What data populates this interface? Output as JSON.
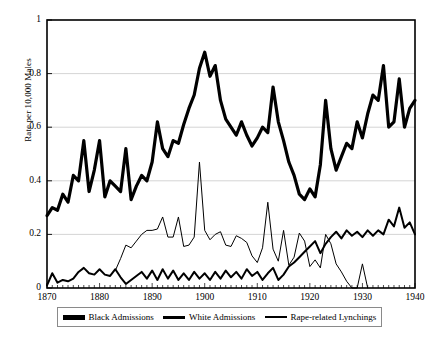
{
  "chart_data": {
    "type": "line",
    "title": "",
    "xlabel": "",
    "ylabel": "Rate per 10,000 Males",
    "xlim": [
      1870,
      1940
    ],
    "ylim": [
      0,
      1
    ],
    "grid": true,
    "legend_position": "bottom",
    "y_ticks": [
      "0",
      "0.2",
      "0.4",
      "0.6",
      "0.8",
      "1"
    ],
    "y_tick_values": [
      0,
      0.2,
      0.4,
      0.6,
      0.8,
      1
    ],
    "x_ticks": [
      "1870",
      "1880",
      "1890",
      "1900",
      "1910",
      "1920",
      "1930",
      "1940"
    ],
    "x_tick_values": [
      1870,
      1880,
      1890,
      1900,
      1910,
      1920,
      1930,
      1940
    ],
    "x_minor_tick_step": 1,
    "series": [
      {
        "name": "Black Admissions",
        "line_width": 3.2,
        "color": "#000000",
        "x": [
          1870,
          1871,
          1872,
          1873,
          1874,
          1875,
          1876,
          1877,
          1878,
          1879,
          1880,
          1881,
          1882,
          1883,
          1884,
          1885,
          1886,
          1887,
          1888,
          1889,
          1890,
          1891,
          1892,
          1893,
          1894,
          1895,
          1896,
          1897,
          1898,
          1899,
          1900,
          1901,
          1902,
          1903,
          1904,
          1905,
          1906,
          1907,
          1908,
          1909,
          1910,
          1911,
          1912,
          1913,
          1914,
          1915,
          1916,
          1917,
          1918,
          1919,
          1920,
          1921,
          1922,
          1923,
          1924,
          1925,
          1926,
          1927,
          1928,
          1929,
          1930,
          1931,
          1932,
          1933,
          1934,
          1935,
          1936,
          1937,
          1938,
          1939,
          1940
        ],
        "values": [
          0.27,
          0.3,
          0.29,
          0.35,
          0.32,
          0.42,
          0.4,
          0.55,
          0.36,
          0.44,
          0.55,
          0.34,
          0.4,
          0.38,
          0.36,
          0.52,
          0.33,
          0.38,
          0.42,
          0.4,
          0.47,
          0.62,
          0.52,
          0.49,
          0.55,
          0.54,
          0.61,
          0.67,
          0.72,
          0.82,
          0.88,
          0.79,
          0.83,
          0.7,
          0.63,
          0.6,
          0.57,
          0.62,
          0.57,
          0.53,
          0.56,
          0.6,
          0.58,
          0.75,
          0.62,
          0.55,
          0.47,
          0.42,
          0.35,
          0.33,
          0.37,
          0.34,
          0.46,
          0.7,
          0.52,
          0.44,
          0.49,
          0.54,
          0.52,
          0.62,
          0.56,
          0.65,
          0.72,
          0.7,
          0.83,
          0.6,
          0.62,
          0.78,
          0.6,
          0.67,
          0.7
        ]
      },
      {
        "name": "White Admissions",
        "line_width": 2.0,
        "color": "#000000",
        "x": [
          1870,
          1871,
          1872,
          1873,
          1874,
          1875,
          1876,
          1877,
          1878,
          1879,
          1880,
          1881,
          1882,
          1883,
          1884,
          1885,
          1886,
          1887,
          1888,
          1889,
          1890,
          1891,
          1892,
          1893,
          1894,
          1895,
          1896,
          1897,
          1898,
          1899,
          1900,
          1901,
          1902,
          1903,
          1904,
          1905,
          1906,
          1907,
          1908,
          1909,
          1910,
          1911,
          1912,
          1913,
          1914,
          1915,
          1916,
          1917,
          1918,
          1919,
          1920,
          1921,
          1922,
          1923,
          1924,
          1925,
          1926,
          1927,
          1928,
          1929,
          1930,
          1931,
          1932,
          1933,
          1934,
          1935,
          1936,
          1937,
          1938,
          1939,
          1940
        ],
        "values": [
          0.01,
          0.055,
          0.02,
          0.03,
          0.025,
          0.035,
          0.06,
          0.075,
          0.055,
          0.05,
          0.07,
          0.05,
          0.045,
          0.07,
          0.04,
          0.015,
          0.03,
          0.045,
          0.06,
          0.035,
          0.065,
          0.03,
          0.07,
          0.035,
          0.065,
          0.03,
          0.055,
          0.03,
          0.06,
          0.035,
          0.055,
          0.03,
          0.06,
          0.035,
          0.065,
          0.04,
          0.06,
          0.035,
          0.07,
          0.045,
          0.06,
          0.03,
          0.055,
          0.075,
          0.03,
          0.05,
          0.08,
          0.095,
          0.115,
          0.135,
          0.155,
          0.175,
          0.13,
          0.165,
          0.19,
          0.21,
          0.185,
          0.215,
          0.195,
          0.21,
          0.19,
          0.215,
          0.195,
          0.215,
          0.2,
          0.255,
          0.23,
          0.3,
          0.225,
          0.245,
          0.2
        ]
      },
      {
        "name": "Rape-related Lynchings",
        "line_width": 1.0,
        "color": "#000000",
        "x": [
          1883,
          1884,
          1885,
          1886,
          1887,
          1888,
          1889,
          1890,
          1891,
          1892,
          1893,
          1894,
          1895,
          1896,
          1897,
          1898,
          1899,
          1900,
          1901,
          1902,
          1903,
          1904,
          1905,
          1906,
          1907,
          1908,
          1909,
          1910,
          1911,
          1912,
          1913,
          1914,
          1915,
          1916,
          1917,
          1918,
          1919,
          1920,
          1921,
          1922,
          1923,
          1924,
          1925,
          1926,
          1927,
          1928,
          1929,
          1930,
          1931
        ],
        "values": [
          0.065,
          0.11,
          0.16,
          0.15,
          0.175,
          0.2,
          0.215,
          0.215,
          0.22,
          0.265,
          0.19,
          0.19,
          0.265,
          0.155,
          0.16,
          0.19,
          0.47,
          0.215,
          0.18,
          0.2,
          0.21,
          0.16,
          0.155,
          0.195,
          0.185,
          0.17,
          0.12,
          0.095,
          0.15,
          0.32,
          0.145,
          0.1,
          0.215,
          0.085,
          0.115,
          0.205,
          0.175,
          0.08,
          0.105,
          0.075,
          0.2,
          0.165,
          0.09,
          0.06,
          0.025,
          0.0,
          0.0,
          0.09,
          0.0
        ]
      }
    ]
  },
  "legend": {
    "items": [
      {
        "label": "Black Admissions",
        "swatch_height": 5
      },
      {
        "label": "White Admissions",
        "swatch_height": 3
      },
      {
        "label": "Rape-related Lynchings",
        "swatch_height": 1
      }
    ]
  }
}
